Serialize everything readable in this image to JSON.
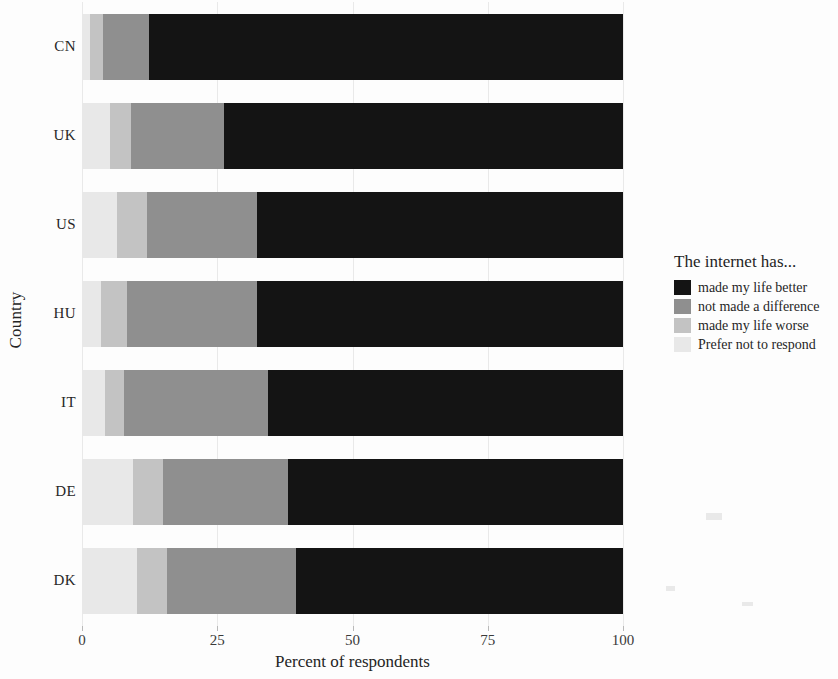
{
  "chart_data": {
    "type": "bar",
    "orientation": "horizontal",
    "stacked": true,
    "stack_mode": "percent",
    "title": "",
    "xlabel": "Percent of respondents",
    "ylabel": "Country",
    "xlim": [
      0,
      100
    ],
    "xticks": [
      0,
      25,
      50,
      75,
      100
    ],
    "xtick_labels": [
      "0",
      "25",
      "50",
      "75",
      "100"
    ],
    "grid": true,
    "grid_axis": "x",
    "legend_position": "right",
    "legend_title": "The internet has...",
    "categories": [
      "CN",
      "UK",
      "US",
      "HU",
      "IT",
      "DE",
      "DK"
    ],
    "series": [
      {
        "name": "made my life better",
        "color": "#141414",
        "values": [
          87.6,
          73.8,
          67.6,
          67.6,
          65.7,
          62.0,
          60.5
        ]
      },
      {
        "name": "not made a difference",
        "color": "#8f8f8f",
        "values": [
          8.5,
          17.2,
          20.3,
          24.0,
          26.6,
          23.1,
          23.7
        ]
      },
      {
        "name": "made my life worse",
        "color": "#c3c3c3",
        "values": [
          2.4,
          3.9,
          5.6,
          4.8,
          3.5,
          5.5,
          5.6
        ]
      },
      {
        "name": "Prefer not to respond",
        "color": "#e8e8e8",
        "values": [
          1.5,
          5.1,
          6.5,
          3.6,
          4.2,
          9.4,
          10.2
        ]
      }
    ],
    "stack_order": [
      "Prefer not to respond",
      "made my life worse",
      "not made a difference",
      "made my life better"
    ]
  },
  "axes": {
    "y_title": "Country",
    "x_title": "Percent of respondents"
  },
  "legend": {
    "title": "The internet has...",
    "items": [
      {
        "label": "made my life better",
        "color": "#141414"
      },
      {
        "label": "not made a difference",
        "color": "#8f8f8f"
      },
      {
        "label": "made my life worse",
        "color": "#c3c3c3"
      },
      {
        "label": "Prefer not to respond",
        "color": "#e8e8e8"
      }
    ]
  }
}
